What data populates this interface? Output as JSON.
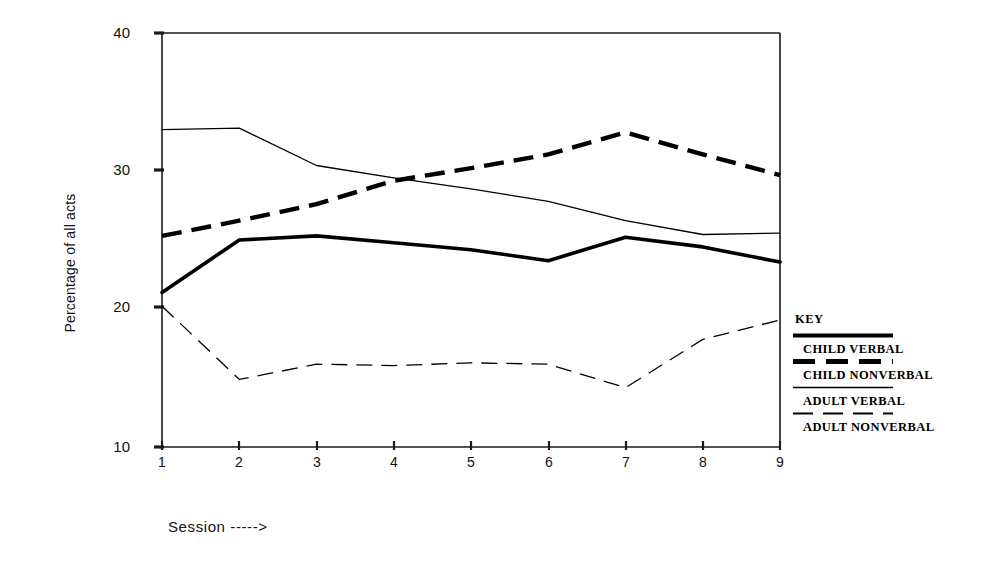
{
  "chart_data": {
    "type": "line",
    "title": "",
    "xlabel": "Session ----->",
    "ylabel": "Percentage of all acts",
    "x": [
      1,
      2,
      3,
      4,
      5,
      6,
      7,
      8,
      9
    ],
    "categories": [
      "1",
      "2",
      "3",
      "4",
      "5",
      "6",
      "7",
      "8",
      "9"
    ],
    "xticklabels": [
      "1",
      "2",
      "3",
      "4",
      "5",
      "6",
      "7",
      "8",
      "9"
    ],
    "yticklabels": [
      "10",
      "20",
      "30",
      "40"
    ],
    "yticks": [
      10,
      20,
      30,
      40
    ],
    "ylim": [
      10,
      40
    ],
    "xlim": [
      1,
      9
    ],
    "grid": false,
    "legend_position": "right",
    "legend_title": "KEY",
    "series": [
      {
        "name": "CHILD VERBAL",
        "style": "thick-solid",
        "values": [
          21.2,
          25.0,
          25.3,
          24.8,
          24.3,
          23.5,
          25.2,
          24.5,
          23.4
        ]
      },
      {
        "name": "CHILD NONVERBAL",
        "style": "thick-dashed",
        "values": [
          25.3,
          26.4,
          27.6,
          29.3,
          30.2,
          31.2,
          32.8,
          31.2,
          29.7
        ]
      },
      {
        "name": "ADULT VERBAL",
        "style": "thin-solid",
        "values": [
          33.0,
          33.1,
          30.4,
          29.5,
          28.7,
          27.8,
          26.4,
          25.4,
          25.5
        ]
      },
      {
        "name": "ADULT NONVERBAL",
        "style": "thin-dashed",
        "values": [
          20.2,
          14.9,
          16.0,
          15.9,
          16.1,
          16.0,
          14.3,
          17.8,
          19.2
        ]
      }
    ]
  },
  "axis": {
    "ylabel_text": "Percentage of all acts",
    "xlabel_text": "Session ----->"
  },
  "key": {
    "title": "KEY",
    "items": [
      {
        "label": "CHILD VERBAL"
      },
      {
        "label": "CHILD NONVERBAL"
      },
      {
        "label": "ADULT VERBAL"
      },
      {
        "label": "ADULT NONVERBAL"
      }
    ]
  },
  "colors": {
    "ink": "#111111",
    "line": "#000000",
    "background": "#ffffff"
  }
}
